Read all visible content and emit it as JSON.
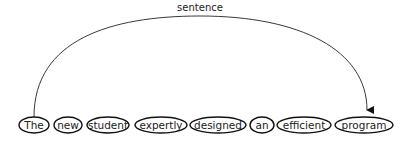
{
  "diagram": {
    "arc_label": "sentence",
    "arc": {
      "from_word_index": 0,
      "to_word_index": 7
    },
    "words": [
      {
        "text": "The",
        "cx": 34,
        "rx": 15
      },
      {
        "text": "new",
        "cx": 68,
        "rx": 14
      },
      {
        "text": "student",
        "cx": 108,
        "rx": 21
      },
      {
        "text": "expertly",
        "cx": 161,
        "rx": 26
      },
      {
        "text": "designed",
        "cx": 218,
        "rx": 28
      },
      {
        "text": "an",
        "cx": 262,
        "rx": 12
      },
      {
        "text": "efficient",
        "cx": 304,
        "rx": 27
      },
      {
        "text": "program",
        "cx": 364,
        "rx": 29
      }
    ]
  }
}
